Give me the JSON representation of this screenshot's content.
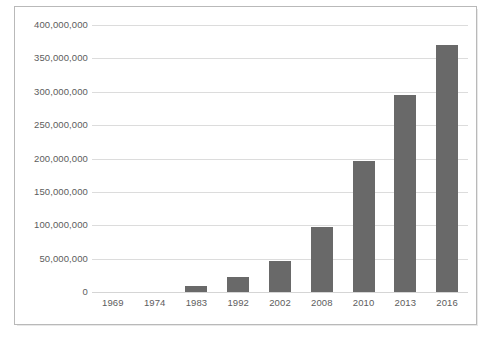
{
  "chart_data": {
    "type": "bar",
    "title": "",
    "subtitle": "",
    "xlabel": "",
    "ylabel": "",
    "categories": [
      "1969",
      "1974",
      "1983",
      "1992",
      "2002",
      "2008",
      "2010",
      "2013",
      "2016"
    ],
    "values": [
      0,
      0,
      9000000,
      22000000,
      46000000,
      97000000,
      196000000,
      295000000,
      370000000
    ],
    "series": [
      {
        "name": "",
        "values": [
          0,
          0,
          9000000,
          22000000,
          46000000,
          97000000,
          196000000,
          295000000,
          370000000
        ]
      }
    ],
    "ylim": [
      0,
      400000000
    ],
    "y_tick_values": [
      0,
      50000000,
      100000000,
      150000000,
      200000000,
      250000000,
      300000000,
      350000000,
      400000000
    ],
    "y_tick_labels": [
      "0",
      "50,000,000",
      "100,000,000",
      "150,000,000",
      "200,000,000",
      "250,000,000",
      "300,000,000",
      "350,000,000",
      "400,000,000"
    ],
    "grid": true,
    "grid_axis": "y",
    "legend": false,
    "legend_position": "none",
    "annotations": [],
    "bar_color": "#696969",
    "gridline_color": "#dcdcdc",
    "axis_text_color": "#5d5d5d",
    "frame_color": "#b9b9b9",
    "background_color": "#ffffff"
  }
}
